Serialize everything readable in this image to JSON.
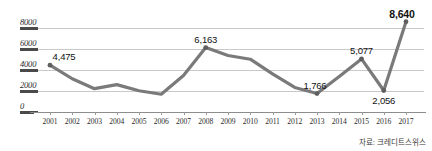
{
  "chart_data": {
    "type": "line",
    "title": "",
    "xlabel": "",
    "ylabel": "",
    "ylim": [
      0,
      8800
    ],
    "yticks": [
      0,
      2000,
      4000,
      6000,
      8000
    ],
    "ytick_labels": [
      "0",
      "2000",
      "4000",
      "6000",
      "8000"
    ],
    "grid": true,
    "legend": null,
    "categories": [
      "2001",
      "2002",
      "2003",
      "2004",
      "2005",
      "2006",
      "2007",
      "2008",
      "2009",
      "2010",
      "2011",
      "2012",
      "2013",
      "2014",
      "2015",
      "2016",
      "2017"
    ],
    "values": [
      4475,
      3180,
      2230,
      2620,
      2030,
      1700,
      3500,
      6163,
      5400,
      5050,
      3650,
      2350,
      1766,
      3400,
      5077,
      2056,
      8640
    ],
    "labeled_points": [
      {
        "category": "2001",
        "value": 4475,
        "label": "4,475",
        "bold": false
      },
      {
        "category": "2008",
        "value": 6163,
        "label": "6,163",
        "bold": false
      },
      {
        "category": "2013",
        "value": 1766,
        "label": "1,766",
        "bold": false
      },
      {
        "category": "2015",
        "value": 5077,
        "label": "5,077",
        "bold": false
      },
      {
        "category": "2016",
        "value": 2056,
        "label": "2,056",
        "bold": false
      },
      {
        "category": "2017",
        "value": 8640,
        "label": "8,640",
        "bold": true
      }
    ],
    "line_color": "#7a7a7a",
    "marker_color": "#5f5f5f",
    "grid_color": "#c9c9c9",
    "axis_color": "#8d8d8d"
  },
  "source": {
    "note": "자료: 크레디트스위스"
  }
}
